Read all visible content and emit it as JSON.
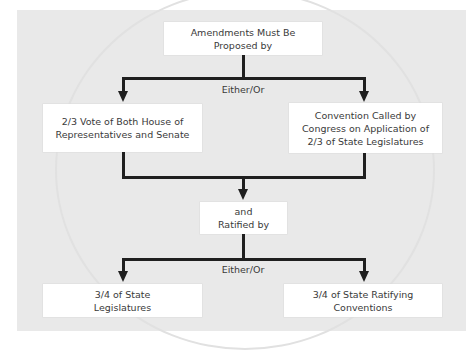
{
  "diagram": {
    "title_box": "Amendments Must Be\nProposed by",
    "proposal_connector_label": "Either/Or",
    "proposal_methods": [
      "2/3 Vote of Both House of\nRepresentatives and Senate",
      "Convention Called by\nCongress on Application of\n2/3 of State Legislatures"
    ],
    "ratification_box": "and\nRatified by",
    "ratification_connector_label": "Either/Or",
    "ratification_methods": [
      "3/4 of State\nLegislatures",
      "3/4 of State Ratifying\nConventions"
    ]
  },
  "colors": {
    "panel_background": "#e9e9e9",
    "box_background": "#ffffff",
    "connector": "#1f1f1f",
    "text": "#3a3a3a"
  }
}
